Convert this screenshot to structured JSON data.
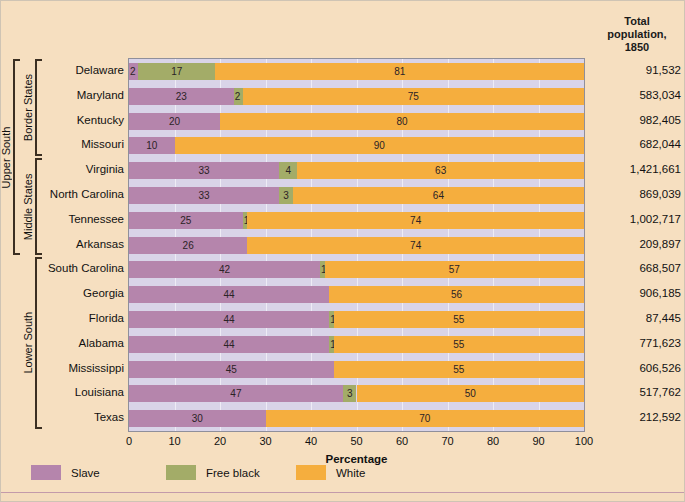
{
  "header": {
    "pop_header_line1": "Total",
    "pop_header_line2": "population,",
    "pop_header_line3": "1850"
  },
  "axis": {
    "x_title": "Percentage",
    "ticks": [
      "0",
      "10",
      "20",
      "30",
      "40",
      "50",
      "60",
      "70",
      "80",
      "90",
      "100"
    ]
  },
  "legend": {
    "items": [
      {
        "label": "Slave",
        "color": "#b585ac"
      },
      {
        "label": "Free black",
        "color": "#a3ac68"
      },
      {
        "label": "White",
        "color": "#f5ae3e"
      }
    ]
  },
  "groups": [
    {
      "label": "Upper South"
    },
    {
      "label": "Border States"
    },
    {
      "label": "Middle States"
    },
    {
      "label": "Lower South"
    }
  ],
  "chart_data": {
    "type": "bar",
    "orientation": "horizontal",
    "stacked": true,
    "title": "",
    "xlabel": "Percentage",
    "ylabel": "",
    "xlim": [
      0,
      100
    ],
    "grid": true,
    "legend_position": "bottom-left",
    "categories": [
      "Delaware",
      "Maryland",
      "Kentucky",
      "Missouri",
      "Virginia",
      "North Carolina",
      "Tennessee",
      "Arkansas",
      "South Carolina",
      "Georgia",
      "Florida",
      "Alabama",
      "Mississippi",
      "Louisiana",
      "Texas"
    ],
    "series": [
      {
        "name": "Slave",
        "color": "#b585ac",
        "values": [
          2,
          23,
          20,
          10,
          33,
          33,
          25,
          26,
          42,
          44,
          44,
          44,
          45,
          47,
          30
        ]
      },
      {
        "name": "Free black",
        "color": "#a3ac68",
        "values": [
          17,
          2,
          0,
          0,
          4,
          3,
          1,
          0,
          1,
          0,
          1,
          1,
          0,
          3,
          0
        ]
      },
      {
        "name": "White",
        "color": "#f5ae3e",
        "values": [
          81,
          75,
          80,
          90,
          63,
          64,
          74,
          74,
          57,
          56,
          55,
          55,
          55,
          50,
          70
        ]
      }
    ],
    "extra_column": {
      "header": "Total population, 1850",
      "values": [
        "91,532",
        "583,034",
        "982,405",
        "682,044",
        "1,421,661",
        "869,039",
        "1,002,717",
        "209,897",
        "668,507",
        "906,185",
        "87,445",
        "771,623",
        "606,526",
        "517,762",
        "212,592"
      ]
    }
  }
}
